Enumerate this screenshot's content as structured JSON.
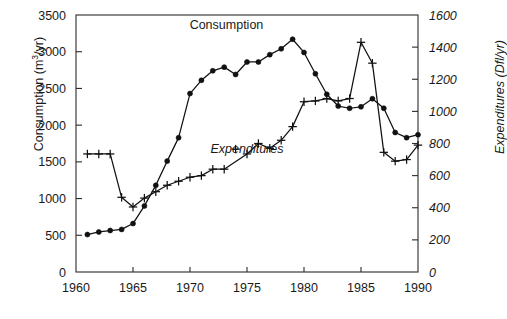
{
  "chart_data": {
    "type": "line",
    "title": "",
    "xlabel": "",
    "ylabel": "Consumption (m3/yr)",
    "ylabel_right": "Expenditures (Dfl/yr)",
    "xlim": [
      1960,
      1990
    ],
    "ylim": [
      0,
      3500
    ],
    "ylim_right": [
      0,
      1600
    ],
    "xticks": [
      1960,
      1965,
      1970,
      1975,
      1980,
      1985,
      1990
    ],
    "yticks_left": [
      0,
      500,
      1000,
      1500,
      2000,
      2500,
      3000,
      3500
    ],
    "yticks_right": [
      0,
      200,
      400,
      600,
      800,
      1000,
      1200,
      1400,
      1600
    ],
    "grid": false,
    "legend_position": "inline-annotations",
    "series": [
      {
        "name": "Consumption",
        "axis": "left",
        "unit": "m3/yr",
        "marker": "filled-circle",
        "x": [
          1961,
          1962,
          1963,
          1964,
          1965,
          1966,
          1967,
          1968,
          1969,
          1970,
          1971,
          1972,
          1973,
          1974,
          1975,
          1976,
          1977,
          1978,
          1979,
          1980,
          1981,
          1982,
          1983,
          1984,
          1985,
          1986,
          1987,
          1988,
          1989,
          1990
        ],
        "values": [
          510,
          545,
          565,
          580,
          660,
          900,
          1180,
          1510,
          1830,
          2430,
          2610,
          2740,
          2790,
          2690,
          2860,
          2860,
          2960,
          3040,
          3170,
          2990,
          2700,
          2420,
          2260,
          2230,
          2250,
          2360,
          2230,
          1900,
          1830,
          1870
        ]
      },
      {
        "name": "Expenditures",
        "axis": "right",
        "unit": "Dfl/yr",
        "marker": "plus",
        "x": [
          1961,
          1962,
          1963,
          1964,
          1965,
          1966,
          1967,
          1968,
          1969,
          1970,
          1971,
          1972,
          1973,
          1975,
          1976,
          1977,
          1978,
          1979,
          1980,
          1981,
          1982,
          1983,
          1984,
          1985,
          1986,
          1987,
          1988,
          1989,
          1990
        ],
        "values": [
          735,
          735,
          735,
          465,
          405,
          460,
          500,
          540,
          565,
          590,
          600,
          640,
          640,
          735,
          800,
          770,
          820,
          905,
          1060,
          1065,
          1080,
          1065,
          1080,
          1430,
          1300,
          745,
          690,
          700,
          790
        ],
        "values_left_scale": [
          1610,
          1610,
          1610,
          1020,
          890,
          1010,
          1100,
          1180,
          1240,
          1290,
          1320,
          1400,
          1400,
          1610,
          1750,
          1690,
          1800,
          1980,
          2320,
          2330,
          2360,
          2330,
          2360,
          3130,
          2850,
          1630,
          1510,
          1530,
          1730
        ]
      },
      {
        "name": "Expenditures outlier",
        "axis": "right",
        "unit": "Dfl/yr",
        "marker": "plus",
        "connected": false,
        "x": [
          1974
        ],
        "values": [
          765
        ],
        "values_left_scale": [
          1680
        ]
      }
    ],
    "annotations": [
      {
        "text": "Consumption",
        "x": 1973.2,
        "y_left": 3310,
        "style": "regular"
      },
      {
        "text": "Expenditures",
        "x": 1975.0,
        "y_left": 1620,
        "style": "italic"
      }
    ]
  },
  "colors": {
    "axis": "#2b2b2b",
    "series_consumption": "#111111",
    "series_expenditures": "#111111",
    "background": "#ffffff",
    "text": "#1a1a1a"
  }
}
